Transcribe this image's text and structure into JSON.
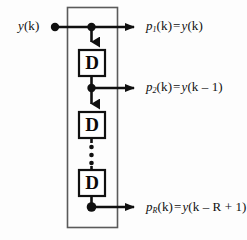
{
  "figure": {
    "name": "tapped-delay-line",
    "background_color": "#fdfdfd",
    "line_color": "#101010",
    "box_border_color": "#4a4a4a"
  },
  "input": {
    "signal_label_main": "y",
    "signal_label_arg": "(k)"
  },
  "delay_blocks": [
    {
      "letter": "D",
      "name": "delay-block-1"
    },
    {
      "letter": "D",
      "name": "delay-block-2"
    },
    {
      "letter": "D",
      "name": "delay-block-3"
    }
  ],
  "vertical_ellipsis": "⋮",
  "outputs": [
    {
      "symbol": "p",
      "subscript": "1",
      "arg": "(k)",
      "equals": "=",
      "expr_fn": "y",
      "expr_arg": "(k)"
    },
    {
      "symbol": "p",
      "subscript": "2",
      "arg": "(k)",
      "equals": "=",
      "expr_fn": "y",
      "expr_arg": "(k – 1)"
    },
    {
      "symbol": "p",
      "subscript": "R",
      "arg": "(k)",
      "equals": "=",
      "expr_fn": "y",
      "expr_arg": "(k – R + 1)"
    }
  ]
}
